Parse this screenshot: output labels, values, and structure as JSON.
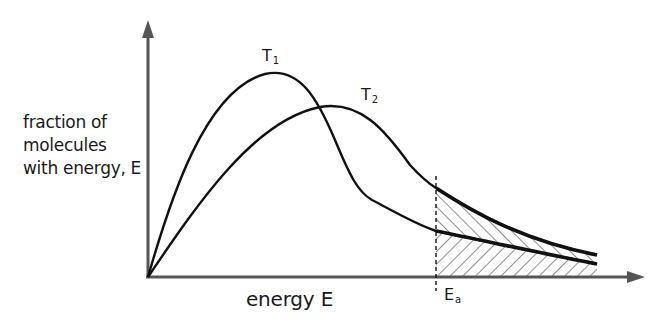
{
  "diagram": {
    "y_axis_label_lines": [
      "fraction of",
      "molecules",
      "with energy, E"
    ],
    "x_axis_label": "energy E",
    "curves": [
      {
        "name": "T1",
        "label_main": "T",
        "label_sub": "1",
        "description": "lower temperature, taller narrower peak"
      },
      {
        "name": "T2",
        "label_main": "T",
        "label_sub": "2",
        "description": "higher temperature, lower broader peak"
      }
    ],
    "threshold": {
      "label_main": "E",
      "label_sub": "a",
      "style": "dashed vertical line"
    },
    "shading": [
      {
        "region": "under T1 beyond Ea",
        "hatch": "back-diagonal"
      },
      {
        "region": "between T1 and T2 beyond Ea",
        "hatch": "forward-diagonal"
      }
    ],
    "colors": {
      "curve": "#111111",
      "axis": "#555555",
      "text": "#1a1a1a",
      "background": "#ffffff"
    }
  }
}
